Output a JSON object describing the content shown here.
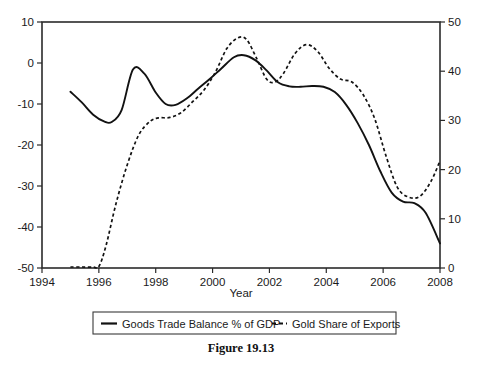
{
  "figure": {
    "caption": "Figure 19.13"
  },
  "chart_data": {
    "type": "line",
    "title": "",
    "xlabel": "Year",
    "ylabel": "",
    "ylabel_right": "",
    "grid": false,
    "legend_position": "bottom",
    "xlim": [
      1994,
      2008
    ],
    "xticks": [
      1994,
      1996,
      1998,
      2000,
      2002,
      2004,
      2006,
      2008
    ],
    "xtick_labels": [
      "1994",
      "1996",
      "1998",
      "2000",
      "2002",
      "2004",
      "2006",
      "2008"
    ],
    "ylim_left": [
      -50,
      10
    ],
    "yticks_left": [
      10,
      0,
      -10,
      -20,
      -30,
      -40,
      -50
    ],
    "ytick_labels_left": [
      "10",
      "0",
      "-10",
      "-20",
      "-30",
      "-40",
      "-50"
    ],
    "ylim_right": [
      0,
      50
    ],
    "yticks_right": [
      50,
      40,
      30,
      20,
      10,
      0
    ],
    "ytick_labels_right": [
      "50",
      "40",
      "30",
      "20",
      "10",
      "0"
    ],
    "series": [
      {
        "name": "Goods Trade Balance % of GDP",
        "style": "solid",
        "axis": "left",
        "x": [
          1995.0,
          1995.4,
          1995.8,
          1996.2,
          1996.45,
          1996.8,
          1997.2,
          1997.6,
          1998.0,
          1998.35,
          1998.7,
          1999.1,
          1999.5,
          1999.9,
          2000.3,
          2000.75,
          2001.1,
          2001.5,
          2001.9,
          2002.3,
          2002.7,
          2003.1,
          2003.5,
          2003.9,
          2004.3,
          2004.7,
          2005.1,
          2005.5,
          2005.9,
          2006.3,
          2006.7,
          2007.1,
          2007.5,
          2008.0
        ],
        "y": [
          -7.0,
          -9.6,
          -12.6,
          -14.3,
          -14.4,
          -11.5,
          -1.6,
          -2.6,
          -7.2,
          -10.0,
          -10.2,
          -8.6,
          -6.2,
          -3.9,
          -1.4,
          1.4,
          1.9,
          0.7,
          -1.8,
          -4.7,
          -5.7,
          -5.8,
          -5.6,
          -5.8,
          -7.1,
          -10.2,
          -14.6,
          -20.0,
          -26.4,
          -31.6,
          -33.8,
          -34.2,
          -36.6,
          -44.0
        ]
      },
      {
        "name": "Gold Share of Exports",
        "style": "dashed",
        "axis": "right",
        "x": [
          1995.0,
          1995.4,
          1995.8,
          1996.0,
          1996.25,
          1996.6,
          1997.0,
          1997.4,
          1997.8,
          1998.1,
          1998.5,
          1998.9,
          1999.3,
          1999.7,
          2000.1,
          2000.5,
          2000.9,
          2001.2,
          2001.55,
          2001.9,
          2002.2,
          2002.5,
          2002.9,
          2003.3,
          2003.7,
          2004.1,
          2004.5,
          2004.9,
          2005.3,
          2005.7,
          2006.1,
          2006.5,
          2006.9,
          2007.3,
          2007.7,
          2008.0
        ],
        "y": [
          0.2,
          0.2,
          0.2,
          0.3,
          4.5,
          13.0,
          21.0,
          27.0,
          29.8,
          30.5,
          30.6,
          31.6,
          33.8,
          36.2,
          39.8,
          44.6,
          46.8,
          46.4,
          42.6,
          38.4,
          37.8,
          39.6,
          43.6,
          45.4,
          44.0,
          40.6,
          38.4,
          37.8,
          35.2,
          30.4,
          22.8,
          16.4,
          14.4,
          14.6,
          17.8,
          21.8
        ]
      }
    ],
    "legend_entries": [
      {
        "label": "Goods Trade Balance % of GDP",
        "style": "solid"
      },
      {
        "label": "Gold Share of Exports",
        "style": "dashed"
      }
    ]
  },
  "artifacts": {
    "bleed_through_text": ""
  }
}
